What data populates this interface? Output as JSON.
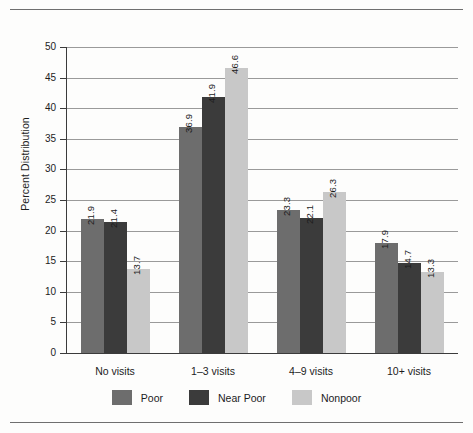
{
  "chart_data": {
    "type": "bar",
    "title": "",
    "xlabel": "",
    "ylabel": "Percent Distribution",
    "categories": [
      "No visits",
      "1–3 visits",
      "4–9 visits",
      "10+ visits"
    ],
    "series": [
      {
        "name": "Poor",
        "color": "#6d6d6d",
        "values": [
          21.9,
          36.9,
          23.3,
          17.9
        ]
      },
      {
        "name": "Near Poor",
        "color": "#3b3b3b",
        "values": [
          21.4,
          41.9,
          22.1,
          14.7
        ]
      },
      {
        "name": "Nonpoor",
        "color": "#c8c8c8",
        "values": [
          13.7,
          46.6,
          26.3,
          13.3
        ]
      }
    ],
    "ylim": [
      0,
      50
    ],
    "ytick_step": 5,
    "yticks": [
      0,
      5,
      10,
      15,
      20,
      25,
      30,
      35,
      40,
      45,
      50
    ],
    "ytick_labels": [
      "0",
      "5",
      "10",
      "15",
      "20",
      "25",
      "30",
      "35",
      "40",
      "45",
      "50"
    ],
    "grid": true,
    "grid_axis": "y",
    "legend_position": "bottom",
    "data_labels": true,
    "data_label_rotation": -90,
    "data_label_values": [
      [
        "21.9",
        "21.4",
        "13.7"
      ],
      [
        "36.9",
        "41.9",
        "46.6"
      ],
      [
        "23.3",
        "22.1",
        "26.3"
      ],
      [
        "17.9",
        "14.7",
        "13.3"
      ]
    ]
  },
  "legend": {
    "items": [
      {
        "label": "Poor",
        "color": "#6d6d6d"
      },
      {
        "label": "Near Poor",
        "color": "#3b3b3b"
      },
      {
        "label": "Nonpoor",
        "color": "#c8c8c8"
      }
    ]
  },
  "colors": {
    "poor": "#6d6d6d",
    "near_poor": "#3b3b3b",
    "nonpoor": "#c8c8c8",
    "axis": "#3b3b3b",
    "grid": "#9a9a9a",
    "rule": "#6f6f6f",
    "text": "#1c1c1c",
    "background": "#fdfdfc"
  }
}
